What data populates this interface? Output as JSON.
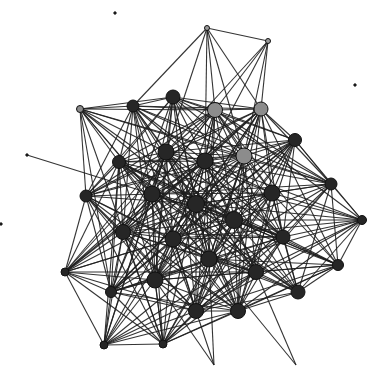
{
  "graph": {
    "type": "network",
    "colors": {
      "node_dark": "#262626",
      "node_grey": "#8c8c8c",
      "edge": "#1e1e1e",
      "background": "#ffffff"
    },
    "nodes": [
      {
        "id": "n0",
        "x": 207,
        "y": 28,
        "r": 2.5,
        "color": "grey_small"
      },
      {
        "id": "n1",
        "x": 268,
        "y": 41,
        "r": 2.5,
        "color": "grey_small"
      },
      {
        "id": "n2",
        "x": 80,
        "y": 109,
        "r": 3.5,
        "color": "grey"
      },
      {
        "id": "n3",
        "x": 133,
        "y": 106,
        "r": 6,
        "color": "dark"
      },
      {
        "id": "n4",
        "x": 173,
        "y": 97,
        "r": 7,
        "color": "dark"
      },
      {
        "id": "n5",
        "x": 215,
        "y": 110,
        "r": 7.5,
        "color": "grey"
      },
      {
        "id": "n6",
        "x": 261,
        "y": 109,
        "r": 7,
        "color": "grey"
      },
      {
        "id": "n7",
        "x": 295,
        "y": 140,
        "r": 6.5,
        "color": "dark"
      },
      {
        "id": "n8",
        "x": 244,
        "y": 156,
        "r": 8,
        "color": "grey"
      },
      {
        "id": "n9",
        "x": 166,
        "y": 152,
        "r": 8,
        "color": "dark"
      },
      {
        "id": "n10",
        "x": 205,
        "y": 161,
        "r": 8,
        "color": "dark"
      },
      {
        "id": "n11",
        "x": 119,
        "y": 162,
        "r": 6.5,
        "color": "dark"
      },
      {
        "id": "n12",
        "x": 331,
        "y": 184,
        "r": 6,
        "color": "dark"
      },
      {
        "id": "n13",
        "x": 272,
        "y": 193,
        "r": 8,
        "color": "dark"
      },
      {
        "id": "n14",
        "x": 152,
        "y": 194,
        "r": 8,
        "color": "dark"
      },
      {
        "id": "n15",
        "x": 196,
        "y": 204,
        "r": 8.5,
        "color": "dark"
      },
      {
        "id": "n16",
        "x": 86,
        "y": 196,
        "r": 6,
        "color": "dark"
      },
      {
        "id": "n17",
        "x": 234,
        "y": 220,
        "r": 8.5,
        "color": "dark"
      },
      {
        "id": "n18",
        "x": 362,
        "y": 220,
        "r": 4.5,
        "color": "dark"
      },
      {
        "id": "n19",
        "x": 123,
        "y": 232,
        "r": 7.5,
        "color": "dark"
      },
      {
        "id": "n20",
        "x": 173,
        "y": 239,
        "r": 8,
        "color": "dark"
      },
      {
        "id": "n21",
        "x": 283,
        "y": 237,
        "r": 7,
        "color": "dark"
      },
      {
        "id": "n22",
        "x": 209,
        "y": 259,
        "r": 8,
        "color": "dark"
      },
      {
        "id": "n23",
        "x": 65,
        "y": 272,
        "r": 4,
        "color": "dark"
      },
      {
        "id": "n24",
        "x": 256,
        "y": 272,
        "r": 7.5,
        "color": "dark"
      },
      {
        "id": "n25",
        "x": 338,
        "y": 265,
        "r": 5.5,
        "color": "dark"
      },
      {
        "id": "n26",
        "x": 155,
        "y": 280,
        "r": 8,
        "color": "dark"
      },
      {
        "id": "n27",
        "x": 111,
        "y": 292,
        "r": 5.5,
        "color": "dark"
      },
      {
        "id": "n28",
        "x": 298,
        "y": 292,
        "r": 7,
        "color": "dark"
      },
      {
        "id": "n29",
        "x": 196,
        "y": 311,
        "r": 7.5,
        "color": "dark"
      },
      {
        "id": "n30",
        "x": 238,
        "y": 311,
        "r": 7.5,
        "color": "dark"
      },
      {
        "id": "n31",
        "x": 104,
        "y": 345,
        "r": 4,
        "color": "dark"
      },
      {
        "id": "n32",
        "x": 163,
        "y": 344,
        "r": 4,
        "color": "dark"
      },
      {
        "id": "p0",
        "x": 115,
        "y": 13,
        "r": 1.2,
        "color": "dark"
      },
      {
        "id": "p1",
        "x": 355,
        "y": 85,
        "r": 1.2,
        "color": "dark"
      },
      {
        "id": "p2",
        "x": 1,
        "y": 224,
        "r": 1.2,
        "color": "dark"
      },
      {
        "id": "e0",
        "x": 27,
        "y": 155,
        "r": 1.2,
        "color": "dark"
      },
      {
        "id": "e1",
        "x": 214,
        "y": 365,
        "r": 0,
        "color": "dark"
      },
      {
        "id": "e2",
        "x": 296,
        "y": 365,
        "r": 0,
        "color": "dark"
      }
    ]
  }
}
